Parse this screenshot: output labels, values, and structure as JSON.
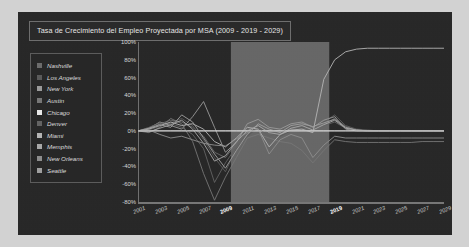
{
  "page": {
    "background_color": "#d2d2d2",
    "panel_color": "#262626"
  },
  "title": {
    "text": "Tasa de Crecimiento del Empleo Proyectada por MSA (2009 - 2019 - 2029)"
  },
  "legend": {
    "position": "left-inside",
    "items": [
      {
        "label": "Nashville",
        "color": "#6b6b6b"
      },
      {
        "label": "Los Angeles",
        "color": "#5a5a5a"
      },
      {
        "label": "New York",
        "color": "#9a9a9a"
      },
      {
        "label": "Austin",
        "color": "#767676"
      },
      {
        "label": "Chicago",
        "color": "#e8e8e8"
      },
      {
        "label": "Denver",
        "color": "#636363"
      },
      {
        "label": "Miami",
        "color": "#b4b4b4"
      },
      {
        "label": "Memphis",
        "color": "#a8a8a8"
      },
      {
        "label": "New Orleans",
        "color": "#8d8d8d"
      },
      {
        "label": "Seattle",
        "color": "#9f9f9f"
      }
    ]
  },
  "chart_data": {
    "type": "line",
    "title": "Tasa de Crecimiento del Empleo Proyectada por MSA (2009 - 2019 - 2029)",
    "xlabel": "",
    "ylabel": "",
    "grid": false,
    "legend_position": "left-inside",
    "ylim": [
      -80,
      100
    ],
    "ytick_values": [
      100,
      80,
      60,
      40,
      20,
      0,
      -20,
      -40,
      -60,
      -80
    ],
    "ytick_labels": [
      "100%",
      "80%",
      "60%",
      "40%",
      "20%",
      "0%",
      "-20%",
      "-40%",
      "-60%",
      "-80%"
    ],
    "xlim": [
      2001,
      2029
    ],
    "xtick_values": [
      2001,
      2003,
      2005,
      2007,
      2009,
      2011,
      2013,
      2015,
      2017,
      2019,
      2021,
      2023,
      2025,
      2027,
      2029
    ],
    "xtick_labels": [
      "2001",
      "2003",
      "2005",
      "2007",
      "2009",
      "2011",
      "2013",
      "2015",
      "2017",
      "2019",
      "2021",
      "2023",
      "2025",
      "2027",
      "2029"
    ],
    "xtick_bold": [
      "2009",
      "2019"
    ],
    "shaded_band": {
      "from": 2009.5,
      "to": 2018.5,
      "color": "#8e8e8e",
      "opacity": 0.62
    },
    "zero_line": {
      "value": 0,
      "color": "#cccccc"
    },
    "x": [
      2001,
      2002,
      2003,
      2004,
      2005,
      2006,
      2007,
      2008,
      2009,
      2010,
      2011,
      2012,
      2013,
      2014,
      2015,
      2016,
      2017,
      2018,
      2019,
      2020,
      2021,
      2022,
      2023,
      2024,
      2025,
      2026,
      2027,
      2028,
      2029
    ],
    "series": [
      {
        "name": "Nashville",
        "color": "#6b6b6b",
        "values": [
          0,
          2,
          8,
          12,
          10,
          4,
          -6,
          -24,
          -30,
          -14,
          2,
          6,
          1,
          -4,
          2,
          5,
          3,
          8,
          14,
          5,
          1,
          0,
          0,
          0,
          0,
          0,
          0,
          0,
          0
        ]
      },
      {
        "name": "Los Angeles",
        "color": "#5a5a5a",
        "values": [
          0,
          1,
          5,
          9,
          14,
          6,
          -10,
          -30,
          -46,
          -20,
          -6,
          4,
          -2,
          -6,
          0,
          4,
          6,
          10,
          18,
          6,
          2,
          1,
          0,
          0,
          0,
          0,
          0,
          0,
          0
        ]
      },
      {
        "name": "New York",
        "color": "#9a9a9a",
        "values": [
          0,
          3,
          10,
          6,
          2,
          16,
          33,
          4,
          -24,
          -13,
          8,
          13,
          4,
          2,
          8,
          10,
          4,
          12,
          16,
          2,
          0,
          0,
          0,
          0,
          0,
          0,
          0,
          0,
          0
        ]
      },
      {
        "name": "Austin",
        "color": "#767676",
        "values": [
          0,
          -2,
          4,
          14,
          8,
          -12,
          -48,
          -78,
          -52,
          -30,
          -8,
          -4,
          -8,
          -12,
          -14,
          -22,
          -36,
          -22,
          -10,
          -12,
          -13,
          -13,
          -13,
          -13,
          -13,
          -13,
          -12,
          -12,
          -12
        ]
      },
      {
        "name": "Chicago",
        "color": "#e8e8e8",
        "values": [
          0,
          0,
          0,
          0,
          0,
          0,
          0,
          0,
          0,
          0,
          0,
          0,
          0,
          0,
          0,
          0,
          0,
          0,
          0,
          0,
          0,
          0,
          0,
          0,
          0,
          0,
          0,
          0,
          0
        ]
      },
      {
        "name": "Denver",
        "color": "#636363",
        "values": [
          0,
          4,
          9,
          8,
          4,
          -4,
          -20,
          -58,
          -36,
          -18,
          -2,
          3,
          -6,
          -2,
          4,
          6,
          2,
          6,
          10,
          3,
          1,
          0,
          0,
          0,
          0,
          0,
          0,
          0,
          0
        ]
      },
      {
        "name": "Miami",
        "color": "#b4b4b4",
        "values": [
          0,
          2,
          6,
          10,
          6,
          8,
          2,
          -12,
          -18,
          -8,
          4,
          2,
          -18,
          -4,
          1,
          2,
          -2,
          58,
          80,
          89,
          92,
          93,
          93,
          93,
          93,
          93,
          93,
          93,
          93
        ]
      },
      {
        "name": "Memphis",
        "color": "#a8a8a8",
        "values": [
          0,
          -1,
          3,
          7,
          12,
          2,
          -14,
          -34,
          -28,
          -12,
          0,
          6,
          -2,
          -4,
          3,
          6,
          1,
          7,
          12,
          3,
          1,
          0,
          0,
          0,
          0,
          0,
          0,
          0,
          0
        ]
      },
      {
        "name": "New Orleans",
        "color": "#8d8d8d",
        "values": [
          0,
          1,
          -4,
          -8,
          -6,
          -10,
          -14,
          -16,
          -17,
          -9,
          -2,
          2,
          -26,
          -10,
          -4,
          -8,
          -30,
          -16,
          -6,
          -8,
          -8,
          -8,
          -8,
          -8,
          -8,
          -8,
          -8,
          -8,
          -8
        ]
      },
      {
        "name": "Seattle",
        "color": "#9f9f9f",
        "values": [
          0,
          3,
          7,
          4,
          18,
          10,
          -8,
          -26,
          -42,
          -22,
          -4,
          8,
          2,
          -2,
          6,
          8,
          5,
          9,
          13,
          4,
          1,
          0,
          0,
          0,
          0,
          0,
          0,
          0,
          0
        ]
      }
    ]
  }
}
